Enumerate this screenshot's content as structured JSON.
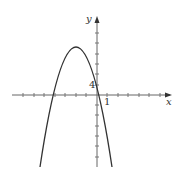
{
  "figure": {
    "type": "parabola graph",
    "axes": {
      "x_label": "x",
      "y_label": "y",
      "x_tick_label": "1",
      "y_tick_label": "4"
    },
    "curve": {
      "description": "downward-opening parabola",
      "y_intercept_label": "4"
    },
    "colors": {
      "axis": "#555555",
      "curve": "#333333",
      "background": "#ffffff"
    }
  }
}
